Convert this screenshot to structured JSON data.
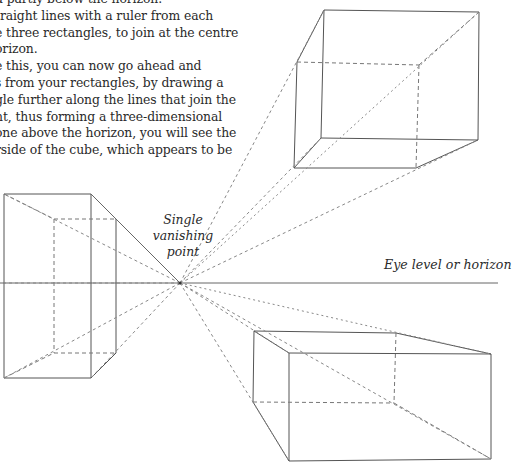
{
  "paragraph": {
    "lines": [
      "d partly below the horizon.",
      "traight lines with a ruler from each",
      "e three rectangles, to join at the centre",
      "orizon.",
      "e this, you can now go ahead and",
      "s from your rectangles, by drawing a",
      "gle further along the lines that join the",
      "nt, thus forming a three-dimensional",
      "one above the horizon, you will see the",
      "rside of the cube, which appears to be"
    ]
  },
  "labels": {
    "vanishing_point": [
      "Single",
      "vanishing",
      "point"
    ],
    "horizon": "Eye level or horizon"
  },
  "diagram": {
    "vanishing_point": [
      180,
      283
    ],
    "horizon_y": 283,
    "stroke_color": "#555555",
    "boxes": {
      "left": {
        "front": [
          [
            4,
            194
          ],
          [
            91,
            194
          ],
          [
            91,
            378
          ],
          [
            4,
            378
          ]
        ],
        "back": [
          [
            54,
            219
          ],
          [
            116,
            219
          ],
          [
            116,
            353
          ],
          [
            54,
            353
          ]
        ]
      },
      "top_right": {
        "front": [
          [
            324,
            10
          ],
          [
            479,
            12
          ],
          [
            478,
            140
          ],
          [
            321,
            138
          ]
        ],
        "back": [
          [
            297,
            62
          ],
          [
            419,
            65
          ],
          [
            416,
            168
          ],
          [
            294,
            168
          ]
        ]
      },
      "bottom_right": {
        "back": [
          [
            254,
            331
          ],
          [
            396,
            333
          ],
          [
            394,
            403
          ],
          [
            253,
            402
          ]
        ],
        "front": [
          [
            289,
            353
          ],
          [
            491,
            354
          ],
          [
            491,
            459
          ],
          [
            289,
            461
          ]
        ]
      }
    }
  }
}
